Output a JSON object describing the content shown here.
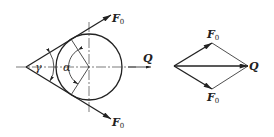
{
  "left_figure": {
    "upper_force": {
      "label": "F",
      "subscript": "0"
    },
    "lower_force": {
      "label": "F",
      "subscript": "0"
    },
    "resultant": {
      "label": "Q"
    },
    "angle_gamma": "γ",
    "angle_alpha": "α"
  },
  "right_figure": {
    "top_force": {
      "label": "F",
      "subscript": "0"
    },
    "bottom_force": {
      "label": "F",
      "subscript": "0"
    },
    "resultant": {
      "label": "Q"
    }
  },
  "colors": {
    "stroke": "#222222",
    "background": "#ffffff"
  }
}
